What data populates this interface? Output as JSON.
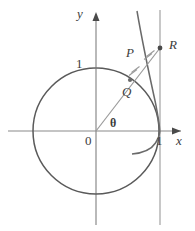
{
  "figure": {
    "colors": {
      "axis": "#8a8a8a",
      "circle": "#5a5a5a",
      "curve": "#6a6a6a",
      "ray": "#9a9a9a",
      "vertical_line": "#9a9a9a",
      "tick_mark": "#9a9a9a",
      "label": "#3c3c3c",
      "background": "#ffffff"
    },
    "axes": {
      "x_label": "x",
      "y_label": "y",
      "origin_label": "0",
      "x_tick_label": "1",
      "y_tick_label": "1"
    },
    "angle_label": "θ",
    "points": [
      {
        "name": "P",
        "label": "P"
      },
      {
        "name": "Q",
        "label": "Q"
      },
      {
        "name": "R",
        "label": "R"
      }
    ],
    "geometry": {
      "origin_px": [
        96,
        131
      ],
      "radius_px": 63,
      "asymptote_x_px": 160,
      "ray_angle_deg": 40,
      "point_Q_px": [
        130,
        80
      ],
      "point_P_px": [
        140,
        63
      ],
      "point_R_px": [
        160,
        48
      ],
      "congruence_ticks_per_segment": 2
    }
  }
}
